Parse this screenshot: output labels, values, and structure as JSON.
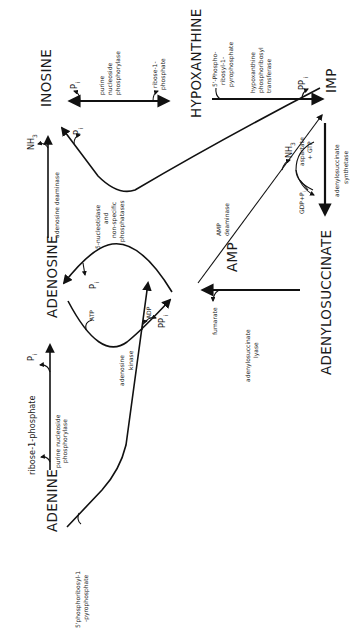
{
  "diagram": {
    "orientation": "rotated 90 degrees counter-clockwise",
    "nodes": {
      "adenine": "ADENINE",
      "adenosine": "ADENOSINE",
      "inosine": "INOSINE",
      "hypoxanthine": "HYPOXANTHINE",
      "amp": "AMP",
      "imp": "IMP",
      "adenylosuccinate": "ADENYLOSUCCINATE"
    },
    "labels": {
      "prpp_adenine_1": "5'phosphoribosyl-1",
      "prpp_adenine_2": "-pyrophosphate",
      "ribose1p_left": "ribose-1-phosphate",
      "pnp_left_1": "purine nucleoside",
      "pnp_left_2": "phosphorylase",
      "pi_left": "P",
      "pi_sub": "i",
      "adenosine_kinase_1": "adenosine",
      "adenosine_kinase_2": "kinase",
      "atp": "ATP",
      "adp": "ADP",
      "pi_adenosine": "P",
      "nucleotidase_1": "5-nucleotidase",
      "nucleotidase_2": "and",
      "nucleotidase_3": "non-specific",
      "nucleotidase_4": "phosphatases",
      "adenosine_deaminase": "adenosine deaminase",
      "nh3_top": "NH",
      "nh3_sub": "3",
      "pi_inosine": "P",
      "pnp_right_1": "purine",
      "pnp_right_2": "nucleoside",
      "pnp_right_3": "phosphorylase",
      "pi_right": "P",
      "ribose1p_right_1": "ribose-1-",
      "ribose1p_right_2": "phosphate",
      "ppi_amp": "PP",
      "fumarate": "fumarate",
      "adss_lyase_1": "adenylosuccinate",
      "adss_lyase_2": "lyase",
      "amp_deaminase_1": "AMP",
      "amp_deaminase_2": "deaminase",
      "nh3_amp": "NH",
      "prpp_hyp_1": "5'-Phospho-",
      "prpp_hyp_2": "ribosyl-1-",
      "prpp_hyp_3": "pyrophosphate",
      "hgprt_1": "hypoxanthine",
      "hgprt_2": "phosphoribosyl",
      "hgprt_3": "transferase",
      "ppi_imp": "PP",
      "aspartate": "aspartate",
      "gtp": "+ GTP",
      "gdp_pi": "GDP+P",
      "adss_1": "adenylosuccinate",
      "adss_2": "synthetase"
    }
  }
}
